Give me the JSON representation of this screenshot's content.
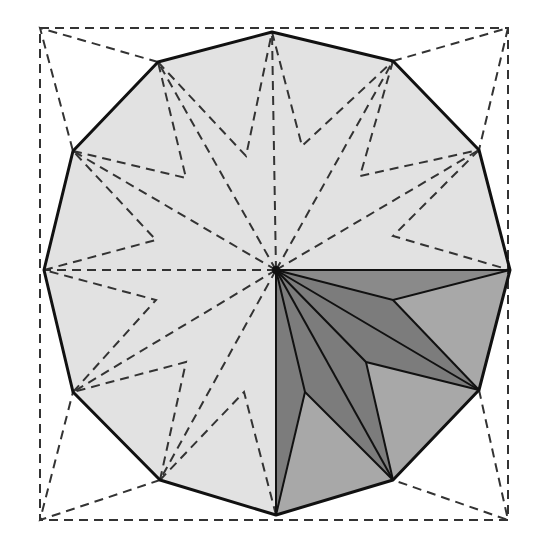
{
  "diagram": {
    "title": "",
    "colors": {
      "background": "#ffffff",
      "polygon_fill": "#e2e2e2",
      "layer_mid": "#a8a8a8",
      "layer_dark": "#7c7c7c",
      "line": "#111111"
    },
    "center": [
      276,
      270
    ],
    "square": [
      [
        40,
        28
      ],
      [
        508,
        28
      ],
      [
        508,
        520
      ],
      [
        40,
        520
      ]
    ],
    "dodecagon_vertices": [
      [
        272,
        32
      ],
      [
        393,
        61
      ],
      [
        479,
        150
      ],
      [
        510,
        270
      ],
      [
        479,
        390
      ],
      [
        393,
        480
      ],
      [
        276,
        515
      ],
      [
        160,
        480
      ],
      [
        73,
        392
      ],
      [
        44,
        270
      ],
      [
        73,
        151
      ],
      [
        158,
        62
      ]
    ]
  }
}
